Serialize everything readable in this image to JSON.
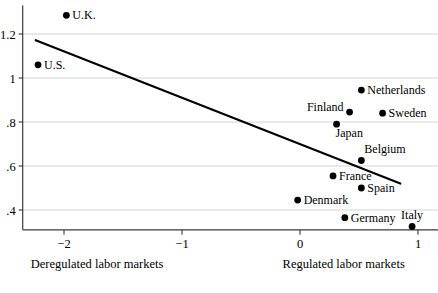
{
  "chart_data": {
    "type": "scatter",
    "title": "",
    "xlabel_left": "Deregulated labor markets",
    "xlabel_right": "Regulated labor markets",
    "ylabel": "",
    "xlim": [
      -2.35,
      1.12
    ],
    "ylim": [
      0.31,
      1.33
    ],
    "xticks": [
      -2,
      -1,
      0,
      1
    ],
    "xticklabels": [
      "−2",
      "−1",
      "0",
      "1"
    ],
    "yticks": [
      0.4,
      0.6,
      0.8,
      1.0,
      1.2
    ],
    "yticklabels": [
      ".4",
      ".6",
      ".8",
      "1",
      "1.2"
    ],
    "grid": "horizontal",
    "legend": "none",
    "points": [
      {
        "label": "U.K.",
        "x": -1.98,
        "y": 1.285,
        "label_side": "right"
      },
      {
        "label": "U.S.",
        "x": -2.22,
        "y": 1.06,
        "label_side": "right"
      },
      {
        "label": "Netherlands",
        "x": 0.52,
        "y": 0.945,
        "label_side": "right"
      },
      {
        "label": "Finland",
        "x": 0.42,
        "y": 0.845,
        "label_side": "left"
      },
      {
        "label": "Sweden",
        "x": 0.7,
        "y": 0.84,
        "label_side": "right"
      },
      {
        "label": "Japan",
        "x": 0.31,
        "y": 0.79,
        "label_side": "below-right"
      },
      {
        "label": "Belgium",
        "x": 0.52,
        "y": 0.625,
        "label_side": "above-right"
      },
      {
        "label": "France",
        "x": 0.28,
        "y": 0.555,
        "label_side": "right"
      },
      {
        "label": "Spain",
        "x": 0.52,
        "y": 0.5,
        "label_side": "right"
      },
      {
        "label": "Denmark",
        "x": -0.02,
        "y": 0.445,
        "label_side": "right"
      },
      {
        "label": "Germany",
        "x": 0.38,
        "y": 0.365,
        "label_side": "right"
      },
      {
        "label": "Italy",
        "x": 0.95,
        "y": 0.325,
        "label_side": "above"
      }
    ],
    "fit_line": {
      "name": "linear fit",
      "x1": -2.24,
      "y1": 1.172,
      "x2": 0.85,
      "y2": 0.52
    },
    "colors": {
      "marker": "#000000",
      "fit_line": "#000000",
      "gridline": "#c8c8c8",
      "axis": "#3a3a3a",
      "background": "#ffffff"
    }
  }
}
